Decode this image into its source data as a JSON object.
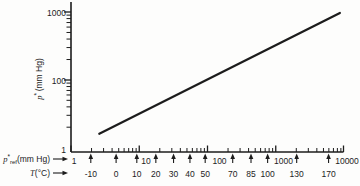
{
  "figure": {
    "background": "#fdfdfc",
    "ink_color": "#1c1c1c"
  },
  "chart_data": {
    "type": "line",
    "scale": "log-log",
    "y_axis": {
      "label_var": "p",
      "label_sup": "*",
      "label_rest": "(mm Hg)",
      "scale": "log",
      "range": [
        1,
        1000
      ],
      "tick_labels": [
        "1000",
        "100",
        "1"
      ],
      "tick_values": [
        1000,
        100,
        1
      ]
    },
    "x_axis": {
      "label_var": "p",
      "label_sup": "*",
      "label_sub": "ref",
      "label_rest": "(mm Hg)",
      "scale": "log",
      "range": [
        1,
        10000
      ],
      "decade_labels": [
        "1",
        "10",
        "100",
        "1000",
        "10000"
      ],
      "decade_values": [
        1,
        10,
        100,
        1000,
        10000
      ]
    },
    "t_axis": {
      "label_var": "T",
      "label_rest": "(°C)",
      "values": [
        "-10",
        "0",
        "10",
        "20",
        "30",
        "40",
        "50",
        "70",
        "85",
        "100",
        "130",
        "170"
      ],
      "positions_pref_mmHg": [
        1.95,
        4.58,
        9.21,
        17.5,
        31.8,
        55.3,
        92.5,
        234,
        434,
        760,
        2026,
        5941
      ]
    },
    "series": [
      {
        "name": "substance-vapor-pressure-line",
        "points": [
          {
            "pref": 2.6,
            "pstar": 3.2
          },
          {
            "pref": 8700,
            "pstar": 970
          }
        ]
      }
    ],
    "legend": null,
    "grid": false
  }
}
